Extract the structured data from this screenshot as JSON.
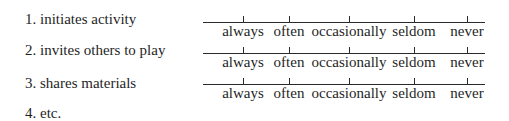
{
  "items": [
    {
      "label": "1. initiates activity"
    },
    {
      "label": "2. invites others to play"
    },
    {
      "label": "3. shares materials"
    },
    {
      "label": "4. etc."
    }
  ],
  "scale_options": [
    "always",
    "often",
    "occasionally",
    "seldom",
    "never"
  ],
  "rated_items_count": 3
}
